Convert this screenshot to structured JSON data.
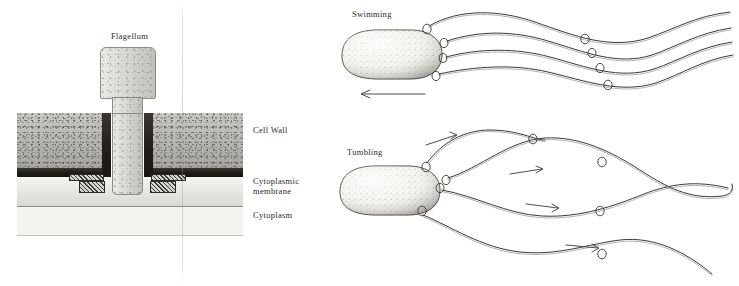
{
  "figure": {
    "style": "pen-and-ink stipple scientific illustration",
    "background_color": "#ffffff",
    "ink_color": "#3c3935"
  },
  "left_panel": {
    "name": "flagellar-basal-body-cross-section",
    "labels": {
      "flagellum": "Flagellum",
      "cell_wall": "Cell Wall",
      "cytoplasmic_membrane_line1": "Cytoplasmic",
      "cytoplasmic_membrane_line2": "membrane",
      "cytoplasm": "Cytoplasm"
    },
    "layers": [
      {
        "name": "cell-wall",
        "color": "#b9b7b2",
        "top": 113,
        "height": 55
      },
      {
        "name": "dark-band",
        "color": "#232019",
        "top": 168,
        "height": 8
      },
      {
        "name": "cytoplasmic-membrane",
        "color": "#e9e7e1",
        "top": 176,
        "height": 30
      },
      {
        "name": "cytoplasm",
        "color": "#f4f3ef",
        "top": 206,
        "height": 30
      }
    ],
    "flagellum_color": "#d6d4cd",
    "ring_color": "#9b9891"
  },
  "right_panel": {
    "name": "bacterial-motility-modes",
    "swimming": {
      "label": "Swimming",
      "description": "flagella bundled into a single coherent helical wave trailing behind the cell",
      "flagella_count": 4,
      "direction_arrow": "left"
    },
    "tumbling": {
      "label": "Tumbling",
      "description": "flagella fly apart into separate divergent waves so the cell rotates in place",
      "flagella_count": 4,
      "rotation_arrows": 4
    }
  }
}
